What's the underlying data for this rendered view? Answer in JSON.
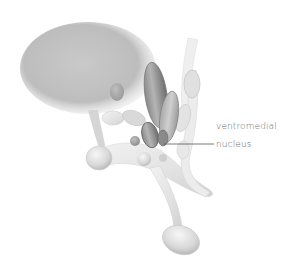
{
  "figure": {
    "labels": [
      {
        "text": "ventromedial",
        "highlighted_structure": "ventromedial nucleus"
      },
      {
        "text": "nucleus"
      }
    ],
    "leader_line": {
      "from": "ventromedial nucleus structure",
      "to": "label"
    }
  },
  "colors": {
    "background": "#ffffff",
    "label_text": "#6d6d6d",
    "highlight_structure": "#5e5e5e",
    "leader_line": "#555555"
  }
}
